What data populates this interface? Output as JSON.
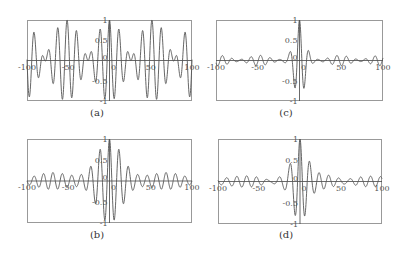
{
  "figure": {
    "background": "#ffffff",
    "frame_color": "#999999",
    "line_color": "#555555",
    "axis_color": "#444444"
  },
  "chart_data": [
    {
      "id": "a",
      "caption": "(a)",
      "type": "line",
      "xlim": [
        -100,
        100
      ],
      "ylim": [
        -1,
        1
      ],
      "xticks": [
        -100,
        -50,
        0,
        50,
        100
      ],
      "xtick_labels": [
        "-100",
        "-50",
        "0",
        "50",
        "100"
      ],
      "yticks": [
        1,
        0.5,
        0,
        -0.5,
        -1
      ],
      "ytick_labels": [
        "1",
        "0.5",
        "0",
        "-0.5",
        "-1"
      ],
      "grid": false,
      "description": "Full-amplitude beating oscillation spanning entire x-range; envelope periodically nulls near x≈-75, -22, 25, 75",
      "signal": {
        "kind": "beat",
        "carrier_freq": 0.55,
        "beat_freq": 0.06,
        "amplitude": 1.0,
        "decay": 0
      }
    },
    {
      "id": "b",
      "caption": "(b)",
      "type": "line",
      "xlim": [
        -100,
        100
      ],
      "ylim": [
        -1,
        1
      ],
      "xticks": [
        -100,
        -50,
        0,
        50,
        100
      ],
      "xtick_labels": [
        "-100",
        "-50",
        "0",
        "50",
        "100"
      ],
      "yticks": [
        1,
        0.5,
        0,
        -0.5,
        -1
      ],
      "ytick_labels": [
        "1",
        "0.5",
        "0",
        "-0.5",
        "-1"
      ],
      "grid": false,
      "description": "Oscillation with peak amplitude 1 at x=0, broad envelope decaying to ~0.2 at edges",
      "signal": {
        "kind": "decay",
        "carrier_freq": 0.55,
        "beat_freq": 0.06,
        "amplitude": 1.0,
        "decay": 0.035
      }
    },
    {
      "id": "c",
      "caption": "(c)",
      "type": "line",
      "xlim": [
        -100,
        100
      ],
      "ylim": [
        -1,
        1
      ],
      "xticks": [
        -100,
        -50,
        0,
        50,
        100
      ],
      "xtick_labels": [
        "-100",
        "-50",
        "0",
        "50",
        "100"
      ],
      "yticks": [
        1,
        0.5,
        0,
        -0.5,
        -1
      ],
      "ytick_labels": [
        "1",
        "0.5",
        "0",
        "-0.5",
        "-1"
      ],
      "grid": false,
      "description": "Sharply localized pulse at x=0 (peak 1, trough ~-0.95 near x=5), small ~0.15 ripples elsewhere",
      "signal": {
        "kind": "pulse",
        "carrier_freq": 0.55,
        "beat_freq": 0.06,
        "amplitude": 1.0,
        "decay": 0.12
      }
    },
    {
      "id": "d",
      "caption": "(d)",
      "type": "line",
      "xlim": [
        -100,
        100
      ],
      "ylim": [
        -1,
        1
      ],
      "xticks": [
        -100,
        -50,
        0,
        50,
        100
      ],
      "xtick_labels": [
        "-100",
        "-50",
        "0",
        "50",
        "100"
      ],
      "yticks": [
        1,
        0.5,
        0,
        -0.5,
        -1
      ],
      "ytick_labels": [
        "1",
        "0.5",
        "0",
        "-0.5",
        "-1"
      ],
      "grid": false,
      "description": "Narrow spike at x=0 (peak 1, trough ~-0.9), side lobes ~0.4, small ripples ~0.1 across range",
      "signal": {
        "kind": "spike",
        "carrier_freq": 0.55,
        "beat_freq": 0.06,
        "amplitude": 1.0,
        "decay": 0.09
      }
    }
  ],
  "panels_layout": {
    "a": {
      "left": 27,
      "top": 20,
      "width": 165,
      "height": 81,
      "cap_x": 97,
      "cap_y": 107
    },
    "b": {
      "left": 27,
      "top": 139,
      "width": 165,
      "height": 84,
      "cap_x": 97,
      "cap_y": 229
    },
    "c": {
      "left": 216,
      "top": 20,
      "width": 167,
      "height": 81,
      "cap_x": 286,
      "cap_y": 107
    },
    "d": {
      "left": 218,
      "top": 139,
      "width": 164,
      "height": 85,
      "cap_x": 286,
      "cap_y": 229
    }
  }
}
